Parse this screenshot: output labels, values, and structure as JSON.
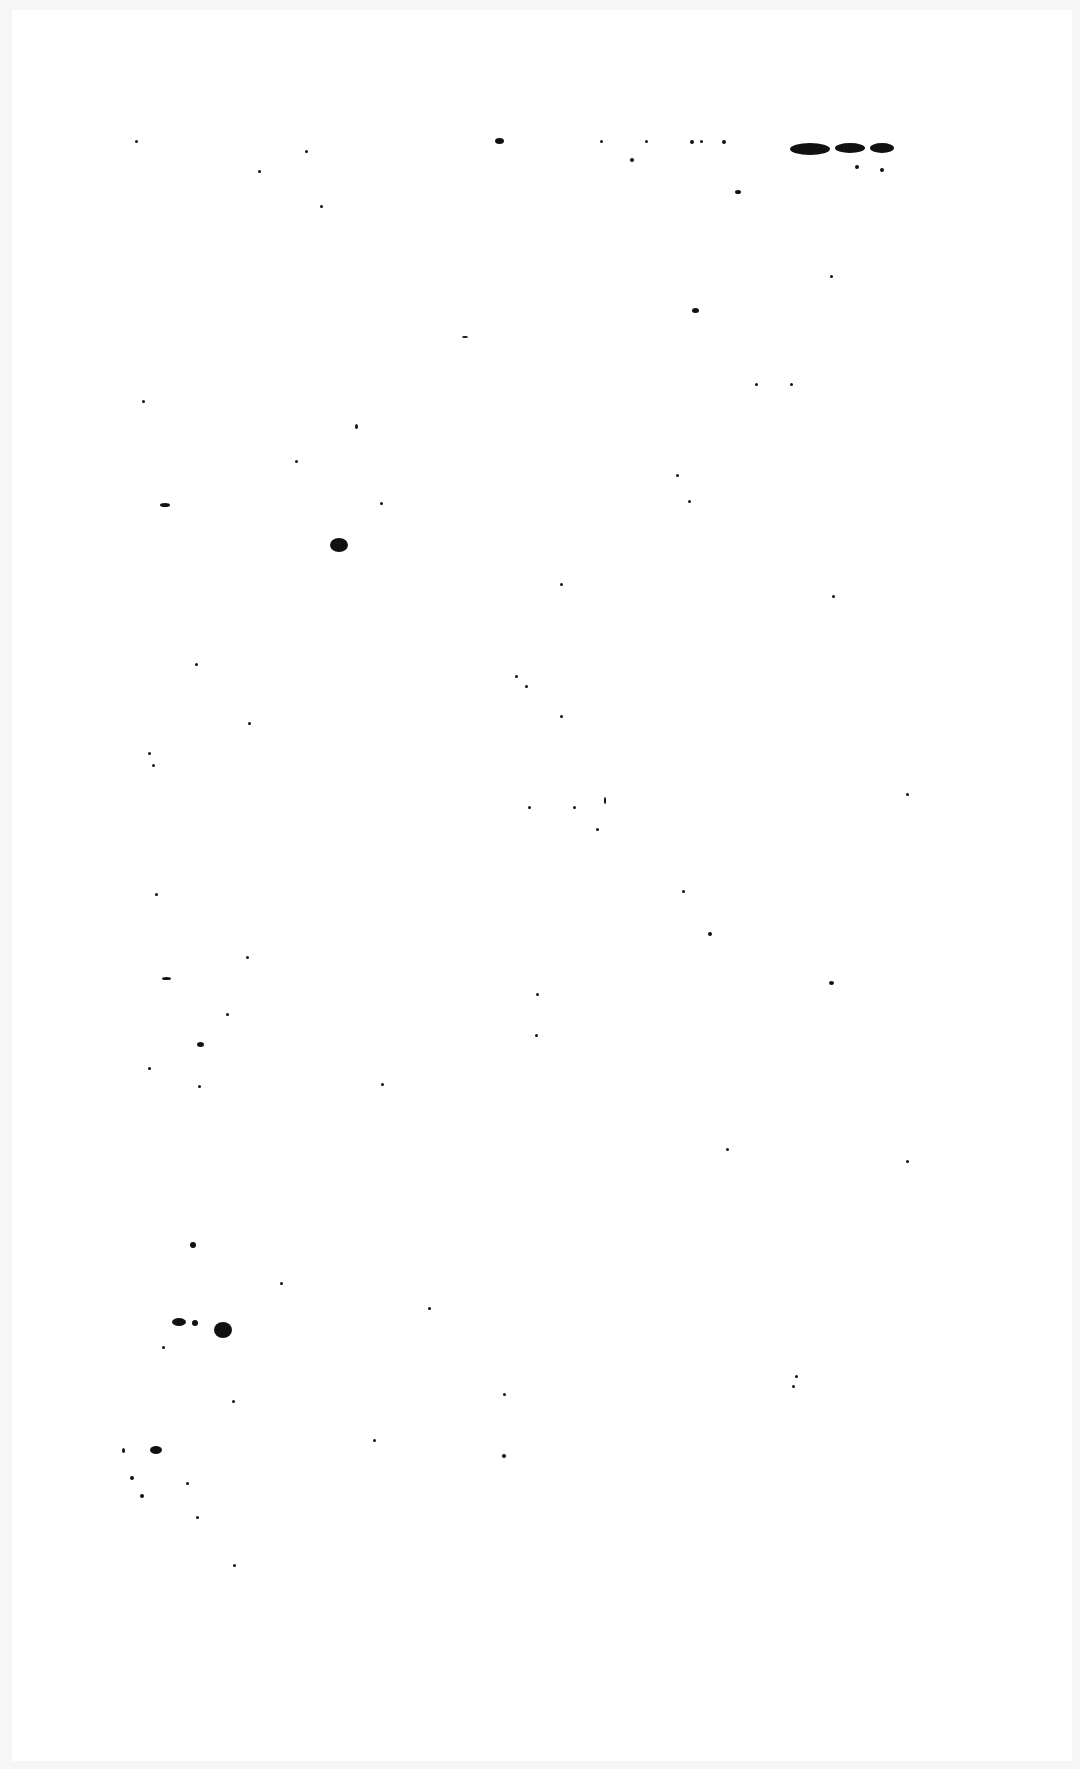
{
  "document": {
    "type": "scanned-page",
    "text": "",
    "background_color": "#ffffff",
    "margin_color": "#f6f6f6",
    "speck_color": "#111111"
  },
  "specks": [
    [
      135,
      140,
      3,
      3
    ],
    [
      305,
      150,
      3,
      3
    ],
    [
      258,
      170,
      3,
      3
    ],
    [
      320,
      205,
      3,
      3
    ],
    [
      495,
      138,
      9,
      6
    ],
    [
      600,
      140,
      3,
      3
    ],
    [
      645,
      140,
      3,
      3
    ],
    [
      630,
      158,
      4,
      4
    ],
    [
      690,
      140,
      4,
      4
    ],
    [
      700,
      140,
      3,
      3
    ],
    [
      722,
      140,
      4,
      4
    ],
    [
      735,
      190,
      6,
      4
    ],
    [
      790,
      143,
      40,
      12
    ],
    [
      835,
      143,
      30,
      10
    ],
    [
      870,
      143,
      24,
      10
    ],
    [
      855,
      165,
      4,
      4
    ],
    [
      880,
      168,
      4,
      4
    ],
    [
      830,
      275,
      3,
      3
    ],
    [
      692,
      308,
      7,
      5
    ],
    [
      462,
      336,
      6,
      2
    ],
    [
      755,
      383,
      3,
      3
    ],
    [
      790,
      383,
      3,
      3
    ],
    [
      142,
      400,
      3,
      3
    ],
    [
      355,
      424,
      3,
      5
    ],
    [
      295,
      460,
      3,
      3
    ],
    [
      676,
      474,
      3,
      3
    ],
    [
      688,
      500,
      3,
      3
    ],
    [
      160,
      503,
      10,
      4
    ],
    [
      380,
      502,
      3,
      3
    ],
    [
      330,
      538,
      18,
      14
    ],
    [
      560,
      583,
      3,
      3
    ],
    [
      832,
      595,
      3,
      3
    ],
    [
      195,
      663,
      3,
      3
    ],
    [
      515,
      675,
      3,
      3
    ],
    [
      525,
      685,
      3,
      3
    ],
    [
      560,
      715,
      3,
      3
    ],
    [
      248,
      722,
      3,
      3
    ],
    [
      148,
      752,
      3,
      3
    ],
    [
      152,
      764,
      3,
      3
    ],
    [
      528,
      806,
      3,
      3
    ],
    [
      573,
      806,
      3,
      3
    ],
    [
      604,
      797,
      2,
      7
    ],
    [
      596,
      828,
      3,
      3
    ],
    [
      906,
      793,
      3,
      3
    ],
    [
      155,
      893,
      3,
      3
    ],
    [
      682,
      890,
      3,
      3
    ],
    [
      708,
      932,
      4,
      4
    ],
    [
      246,
      956,
      3,
      3
    ],
    [
      162,
      977,
      9,
      3
    ],
    [
      829,
      981,
      5,
      4
    ],
    [
      536,
      993,
      3,
      3
    ],
    [
      226,
      1013,
      3,
      3
    ],
    [
      197,
      1042,
      7,
      5
    ],
    [
      535,
      1034,
      3,
      3
    ],
    [
      148,
      1067,
      3,
      3
    ],
    [
      198,
      1085,
      3,
      3
    ],
    [
      381,
      1083,
      3,
      3
    ],
    [
      726,
      1148,
      3,
      3
    ],
    [
      906,
      1160,
      3,
      3
    ],
    [
      190,
      1242,
      6,
      6
    ],
    [
      280,
      1282,
      3,
      3
    ],
    [
      428,
      1307,
      3,
      3
    ],
    [
      172,
      1318,
      14,
      8
    ],
    [
      192,
      1320,
      6,
      6
    ],
    [
      214,
      1322,
      18,
      16
    ],
    [
      162,
      1346,
      3,
      3
    ],
    [
      232,
      1400,
      3,
      3
    ],
    [
      503,
      1393,
      3,
      3
    ],
    [
      792,
      1385,
      3,
      3
    ],
    [
      795,
      1375,
      3,
      3
    ],
    [
      373,
      1439,
      3,
      3
    ],
    [
      502,
      1454,
      4,
      4
    ],
    [
      122,
      1448,
      3,
      5
    ],
    [
      150,
      1446,
      12,
      8
    ],
    [
      130,
      1476,
      4,
      4
    ],
    [
      140,
      1494,
      4,
      4
    ],
    [
      186,
      1482,
      3,
      3
    ],
    [
      196,
      1516,
      3,
      3
    ],
    [
      233,
      1564,
      3,
      3
    ]
  ]
}
